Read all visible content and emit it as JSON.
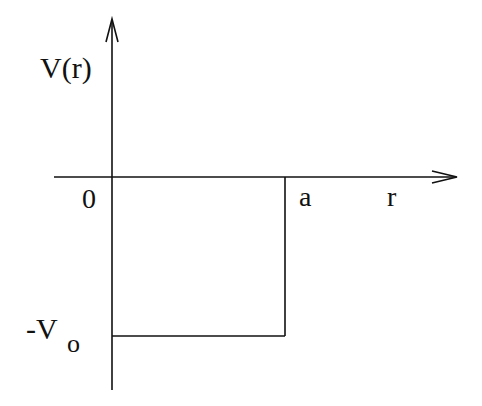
{
  "diagram": {
    "type": "square-well-potential",
    "y_axis_label": "V(r)",
    "x_axis_label": "r",
    "origin_label": "0",
    "well_edge_label": "a",
    "well_depth_label": {
      "main": "-V",
      "subscript": "o"
    },
    "colors": {
      "background": "#ffffff",
      "line": "#111111"
    }
  }
}
